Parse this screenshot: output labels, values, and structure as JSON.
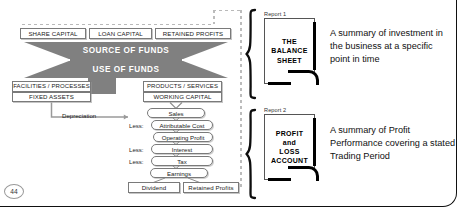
{
  "page": {
    "number": "44"
  },
  "funds": {
    "sources": [
      {
        "label": "SHARE CAPITAL"
      },
      {
        "label": "LOAN CAPITAL"
      },
      {
        "label": "RETAINED PROFITS"
      }
    ],
    "source_band": "SOURCE OF FUNDS",
    "use_band": "USE OF FUNDS",
    "uses_left": [
      {
        "label": "FACILITIES / PROCESSES"
      },
      {
        "label": "FIXED ASSETS"
      }
    ],
    "uses_right": [
      {
        "label": "PRODUCTS / SERVICES"
      },
      {
        "label": "WORKING CAPITAL"
      }
    ],
    "depreciation_label": "Depreciation"
  },
  "pl": {
    "less_label": "Less:",
    "rows": [
      {
        "label": "Sales"
      },
      {
        "label": "Attributable Cost"
      },
      {
        "label": "Operating Profit"
      },
      {
        "label": "Interest"
      },
      {
        "label": "Tax"
      },
      {
        "label": "Earnings"
      }
    ],
    "dividend": "Dividend",
    "retained_profits": "Retained Profits"
  },
  "reports": [
    {
      "caption": "Report 1",
      "title": "THE\nBALANCE\nSHEET",
      "title_lines": [
        "THE",
        "BALANCE",
        "SHEET"
      ],
      "description": "A summary of investment in the business at a specific point in time"
    },
    {
      "caption": "Report 2",
      "title_lines": [
        "PROFIT",
        "and",
        "LOSS",
        "ACCOUNT"
      ],
      "description": "A summary of Profit Performance covering a stated Trading Period"
    }
  ],
  "colors": {
    "band": "#808080",
    "border": "#7a7a7a",
    "dash": "#bcbcbc",
    "ink": "#111111"
  }
}
